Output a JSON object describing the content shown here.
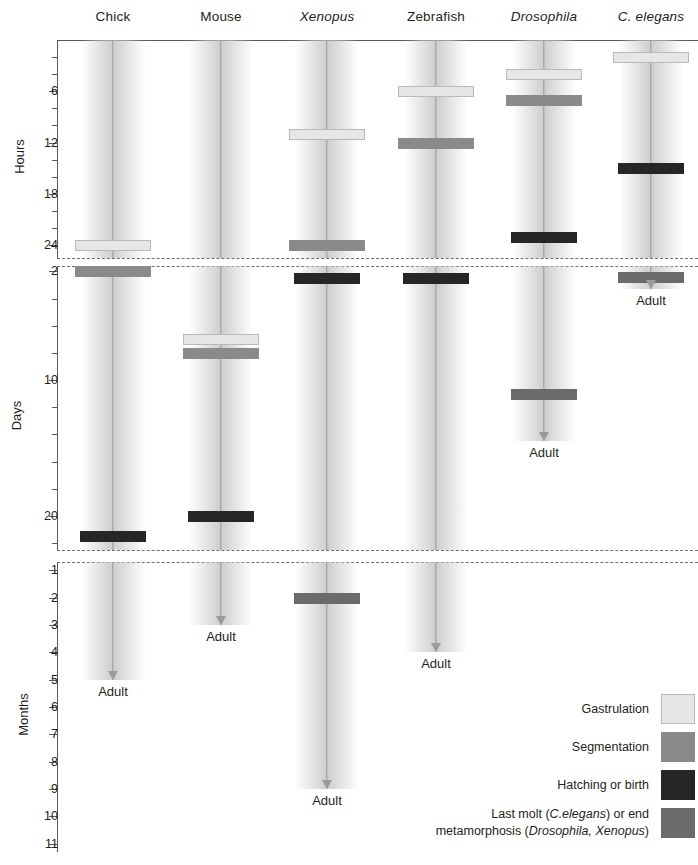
{
  "columns": [
    {
      "label": "Chick",
      "italic": false,
      "x": 113
    },
    {
      "label": "Mouse",
      "italic": false,
      "x": 221
    },
    {
      "label": "Xenopus",
      "italic": true,
      "x": 327
    },
    {
      "label": "Zebrafish",
      "italic": false,
      "x": 436
    },
    {
      "label": "Drosophila",
      "italic": true,
      "x": 544
    },
    {
      "label": "C. elegans",
      "italic": true,
      "x": 651
    }
  ],
  "axes": {
    "hours": {
      "title": "Hours",
      "ticks_major": [
        6,
        12,
        18,
        24
      ],
      "ticks_minor": [
        2,
        4,
        8,
        10,
        14,
        16,
        20,
        22
      ],
      "range": [
        0,
        25.5
      ]
    },
    "days": {
      "title": "Days",
      "ticks_major": [
        2,
        10,
        20
      ],
      "ticks_minor": [
        4,
        6,
        8,
        12,
        14,
        16,
        18,
        22
      ],
      "range": [
        1.6,
        22.5
      ]
    },
    "months": {
      "title": "Months",
      "ticks_major": [
        1,
        2,
        3,
        4,
        5,
        6,
        7,
        8,
        9,
        10,
        11
      ],
      "ticks_minor": [],
      "range": [
        0.7,
        11.3
      ]
    }
  },
  "legend": {
    "items": [
      {
        "key": "gastrulation",
        "label": "Gastrulation",
        "color": "#e6e6e6"
      },
      {
        "key": "segmentation",
        "label": "Segmentation",
        "color": "#8a8a8a"
      },
      {
        "key": "hatching",
        "label": "Hatching or birth",
        "color": "#262626"
      },
      {
        "key": "molt",
        "label": "Last molt (C.elegans) or end metamorphosis (Drosophila, Xenopus)",
        "color": "#6b6b6b"
      }
    ]
  },
  "adult_label": "Adult",
  "chart_data": {
    "type": "timeline",
    "xlabel": "",
    "ylabel": "Time (Hours / Days / Months, broken axis)",
    "panels": [
      "Hours",
      "Days",
      "Months"
    ],
    "event_types": [
      "Gastrulation",
      "Segmentation",
      "Hatching or birth",
      "Last molt / end metamorphosis"
    ],
    "species": [
      {
        "name": "Chick",
        "events": [
          {
            "type": "Gastrulation",
            "panel": "Hours",
            "value": 24,
            "unit": "h"
          },
          {
            "type": "Segmentation",
            "panel": "Days",
            "value": 2,
            "unit": "d"
          },
          {
            "type": "Hatching or birth",
            "panel": "Days",
            "value": 21.5,
            "unit": "d"
          }
        ],
        "adult": {
          "panel": "Months",
          "value": 5,
          "unit": "mo"
        }
      },
      {
        "name": "Mouse",
        "events": [
          {
            "type": "Gastrulation",
            "panel": "Days",
            "value": 7,
            "unit": "d"
          },
          {
            "type": "Segmentation",
            "panel": "Days",
            "value": 8,
            "unit": "d"
          },
          {
            "type": "Hatching or birth",
            "panel": "Days",
            "value": 20,
            "unit": "d"
          }
        ],
        "adult": {
          "panel": "Months",
          "value": 3,
          "unit": "mo"
        }
      },
      {
        "name": "Xenopus",
        "events": [
          {
            "type": "Gastrulation",
            "panel": "Hours",
            "value": 11,
            "unit": "h"
          },
          {
            "type": "Segmentation",
            "panel": "Hours",
            "value": 24,
            "unit": "h"
          },
          {
            "type": "Hatching or birth",
            "panel": "Days",
            "value": 2.5,
            "unit": "d"
          },
          {
            "type": "Last molt / end metamorphosis",
            "panel": "Months",
            "value": 2,
            "unit": "mo"
          }
        ],
        "adult": {
          "panel": "Months",
          "value": 9,
          "unit": "mo"
        }
      },
      {
        "name": "Zebrafish",
        "events": [
          {
            "type": "Gastrulation",
            "panel": "Hours",
            "value": 6,
            "unit": "h"
          },
          {
            "type": "Segmentation",
            "panel": "Hours",
            "value": 12,
            "unit": "h"
          },
          {
            "type": "Hatching or birth",
            "panel": "Days",
            "value": 2.5,
            "unit": "d"
          }
        ],
        "adult": {
          "panel": "Months",
          "value": 4,
          "unit": "mo"
        }
      },
      {
        "name": "Drosophila",
        "events": [
          {
            "type": "Gastrulation",
            "panel": "Hours",
            "value": 4,
            "unit": "h"
          },
          {
            "type": "Segmentation",
            "panel": "Hours",
            "value": 7,
            "unit": "h"
          },
          {
            "type": "Hatching or birth",
            "panel": "Hours",
            "value": 23,
            "unit": "h"
          },
          {
            "type": "Last molt / end metamorphosis",
            "panel": "Days",
            "value": 11,
            "unit": "d"
          }
        ],
        "adult": {
          "panel": "Days",
          "value": 14.5,
          "unit": "d"
        }
      },
      {
        "name": "C. elegans",
        "events": [
          {
            "type": "Gastrulation",
            "panel": "Hours",
            "value": 2,
            "unit": "h"
          },
          {
            "type": "Hatching or birth",
            "panel": "Hours",
            "value": 15,
            "unit": "h"
          },
          {
            "type": "Last molt / end metamorphosis",
            "panel": "Days",
            "value": 2.4,
            "unit": "d"
          }
        ],
        "adult": {
          "panel": "Days",
          "value": 3.3,
          "unit": "d"
        }
      }
    ]
  }
}
